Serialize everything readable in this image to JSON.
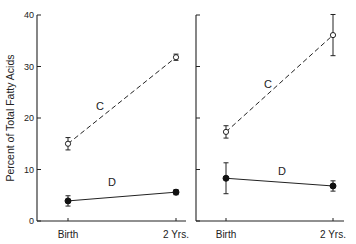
{
  "chart_data": {
    "type": "line",
    "ylabel": "Percent of Total Fatty Acids",
    "ylim": [
      0,
      40
    ],
    "yticks": [
      0,
      10,
      20,
      30,
      40
    ],
    "categories": [
      "Birth",
      "2 Yrs."
    ],
    "grid": false,
    "legend": "inline labels",
    "panels": [
      {
        "name": "left",
        "series": [
          {
            "name": "C",
            "style": "dashed, open circles",
            "values": [
              15.0,
              31.8
            ],
            "errors": [
              1.2,
              0.6
            ]
          },
          {
            "name": "D",
            "style": "solid, filled circles",
            "values": [
              3.9,
              5.6
            ],
            "errors": [
              1.0,
              0.5
            ]
          }
        ]
      },
      {
        "name": "right",
        "series": [
          {
            "name": "C",
            "style": "dashed, open circles",
            "values": [
              17.3,
              36.1
            ],
            "errors": [
              1.2,
              4.0
            ]
          },
          {
            "name": "D",
            "style": "solid, filled circles",
            "values": [
              8.3,
              6.8
            ],
            "errors": [
              3.0,
              1.0
            ]
          }
        ]
      }
    ]
  },
  "labels": {
    "ylabel": "Percent of Total Fatty Acids",
    "yticks": [
      "0",
      "10",
      "20",
      "30",
      "40"
    ],
    "x_birth": "Birth",
    "x_2yrs": "2 Yrs.",
    "series_c": "C",
    "series_d": "D"
  }
}
